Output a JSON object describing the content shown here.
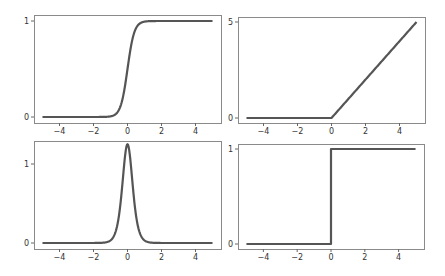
{
  "figure": {
    "line_color": "#555555",
    "frame_color": "#8a8a8a",
    "background": "#ffffff"
  },
  "chart_data": [
    {
      "id": "sigmoid",
      "type": "line",
      "title": "",
      "xlabel": "",
      "ylabel": "",
      "xlim": [
        -5.5,
        5.5
      ],
      "ylim": [
        -0.05,
        1.05
      ],
      "xticks": [
        -4,
        -2,
        0,
        2,
        4
      ],
      "xtick_labels": [
        "−4",
        "−2",
        "0",
        "2",
        "4"
      ],
      "yticks": [
        0,
        1
      ],
      "ytick_labels": [
        "0",
        "1"
      ],
      "grid": false,
      "legend": null,
      "function": "1/(1+exp(-5x))",
      "x": [
        -5,
        -4,
        -3,
        -2,
        -1,
        -0.5,
        0,
        0.5,
        1,
        2,
        3,
        4,
        5
      ],
      "y": [
        0.0,
        0.0,
        0.0,
        0.0,
        0.007,
        0.076,
        0.5,
        0.924,
        0.993,
        1.0,
        1.0,
        1.0,
        1.0
      ]
    },
    {
      "id": "relu",
      "type": "line",
      "title": "",
      "xlabel": "",
      "ylabel": "",
      "xlim": [
        -5.5,
        5.5
      ],
      "ylim": [
        -0.25,
        5.25
      ],
      "xticks": [
        -4,
        -2,
        0,
        2,
        4
      ],
      "xtick_labels": [
        "−4",
        "−2",
        "0",
        "2",
        "4"
      ],
      "yticks": [
        0,
        5
      ],
      "ytick_labels": [
        "0",
        "5"
      ],
      "grid": false,
      "legend": null,
      "function": "max(0, x)",
      "x": [
        -5,
        -4,
        -3,
        -2,
        -1,
        0,
        1,
        2,
        3,
        4,
        5
      ],
      "y": [
        0,
        0,
        0,
        0,
        0,
        0,
        1,
        2,
        3,
        4,
        5
      ]
    },
    {
      "id": "sigmoid-derivative-peak",
      "type": "line",
      "title": "",
      "xlabel": "",
      "ylabel": "",
      "xlim": [
        -5.5,
        5.5
      ],
      "ylim": [
        -0.06,
        1.3
      ],
      "xticks": [
        -4,
        -2,
        0,
        2,
        4
      ],
      "xtick_labels": [
        "−4",
        "−2",
        "0",
        "2",
        "4"
      ],
      "yticks": [
        0,
        1
      ],
      "ytick_labels": [
        "0",
        "1"
      ],
      "grid": false,
      "legend": null,
      "function": "5*s(x)*(1-s(x)), s=sigmoid(5x)",
      "x": [
        -5,
        -2,
        -1,
        -0.5,
        -0.25,
        0,
        0.25,
        0.5,
        1,
        2,
        5
      ],
      "y": [
        0.0,
        0.0,
        0.03,
        0.35,
        0.98,
        1.25,
        0.98,
        0.35,
        0.03,
        0.0,
        0.0
      ]
    },
    {
      "id": "step",
      "type": "line",
      "title": "",
      "xlabel": "",
      "ylabel": "",
      "xlim": [
        -5.5,
        5.5
      ],
      "ylim": [
        -0.05,
        1.05
      ],
      "xticks": [
        -4,
        -2,
        0,
        2,
        4
      ],
      "xtick_labels": [
        "−4",
        "−2",
        "0",
        "2",
        "4"
      ],
      "yticks": [
        0,
        1
      ],
      "ytick_labels": [
        "0",
        "1"
      ],
      "grid": false,
      "legend": null,
      "function": "heaviside(x)",
      "x": [
        -5,
        0,
        0,
        5
      ],
      "y": [
        0,
        0,
        1,
        1
      ]
    }
  ],
  "panels": [
    {
      "frame": [
        34,
        15,
        221,
        123
      ],
      "y_px": [
        117,
        21
      ]
    },
    {
      "frame": [
        238,
        17,
        425,
        123
      ],
      "y_px": [
        118,
        22
      ]
    },
    {
      "frame": [
        34,
        141,
        221,
        249
      ],
      "y_px": [
        243,
        164
      ]
    },
    {
      "frame": [
        238,
        144,
        424,
        249
      ],
      "y_px": [
        244,
        149
      ]
    }
  ]
}
